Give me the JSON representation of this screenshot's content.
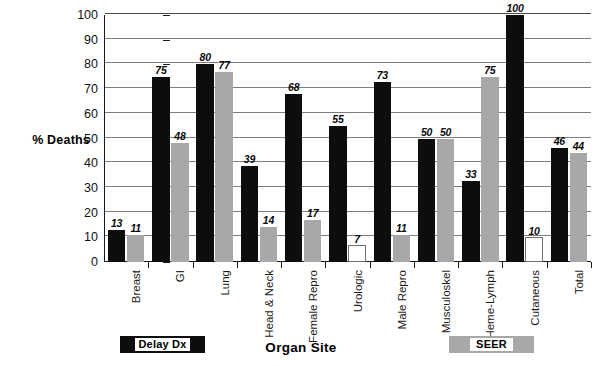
{
  "chart_data": {
    "type": "bar",
    "title": "",
    "xlabel": "Organ Site",
    "ylabel": "% Deaths",
    "ylim": [
      0,
      100
    ],
    "ytick_step": 10,
    "grid": true,
    "legend_position": "bottom",
    "categories": [
      "Breast",
      "GI",
      "Lung",
      "Head & Neck",
      "Female Repro",
      "Urologic",
      "Male Repro",
      "Musculoskel",
      "Heme-Lymph",
      "Cutaneous",
      "Total"
    ],
    "yticks": [
      0,
      10,
      20,
      30,
      40,
      50,
      60,
      70,
      80,
      90,
      100
    ],
    "series": [
      {
        "name": "Delay Dx",
        "color": "#0d0d0d",
        "values": [
          13,
          75,
          80,
          39,
          68,
          55,
          73,
          50,
          33,
          100,
          46
        ]
      },
      {
        "name": "SEER",
        "color": "#a8a8a8",
        "values": [
          11,
          48,
          77,
          14,
          17,
          7,
          11,
          50,
          75,
          10,
          44
        ]
      }
    ]
  },
  "legend": {
    "items": [
      {
        "label": "Delay Dx",
        "swatch": "#0d0d0d"
      },
      {
        "label": "SEER",
        "swatch": "#a8a8a8"
      }
    ]
  },
  "axes": {
    "y_title": "% Deaths",
    "x_title": "Organ Site"
  }
}
